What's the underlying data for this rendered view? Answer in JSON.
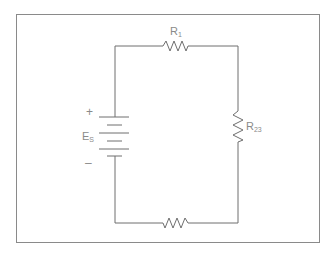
{
  "diagram": {
    "type": "series circuit",
    "source": {
      "label": "E",
      "subscript": "S",
      "positive_sign": "+",
      "negative_sign": "–"
    },
    "resistors": [
      {
        "id": "top",
        "label": "R",
        "subscript": "1"
      },
      {
        "id": "right",
        "label": "R",
        "subscript": "23"
      },
      {
        "id": "bottom",
        "label": "",
        "subscript": ""
      }
    ],
    "colors": {
      "line": "#6e6e6e",
      "frame": "#8a8a8a",
      "text": "#8a8a8a"
    }
  }
}
